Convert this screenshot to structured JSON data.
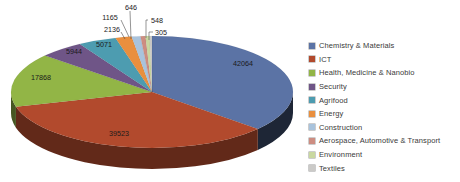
{
  "chart_data": {
    "type": "pie",
    "style": "3d-pie",
    "title": "",
    "legend_position": "right",
    "background": "#ffffff",
    "categories": [
      "Chemistry & Materials",
      "ICT",
      "Health, Medicine & Nanobio",
      "Security",
      "Agrifood",
      "Energy",
      "Construction",
      "Aerospace, Automotive & Transport",
      "Environment",
      "Textiles"
    ],
    "values": [
      42064,
      39523,
      17868,
      5944,
      5071,
      2136,
      1165,
      646,
      548,
      305
    ],
    "data_labels": [
      "42064",
      "39523",
      "17868",
      "5944",
      "5071",
      "2136",
      "1165",
      "646",
      "548",
      "305"
    ],
    "colors": [
      "#5b73a5",
      "#b24a2d",
      "#92b546",
      "#6f5587",
      "#4d9cb0",
      "#e98f3e",
      "#a9c3dc",
      "#cd8d81",
      "#c9d8a0",
      "#cbcac8"
    ],
    "label_text_color": "#1a1a1a",
    "legend_text_color": "#3a3a3a",
    "leader_line_color": "#4d4d4d"
  }
}
